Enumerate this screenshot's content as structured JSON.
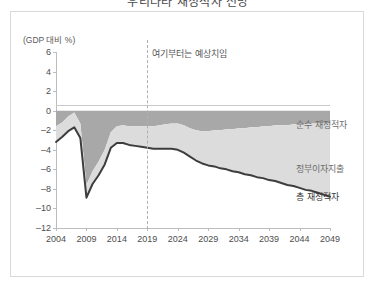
{
  "title": "우리나라 재정적자 전망",
  "card": {
    "unit_caption": "(GDP 대비 %)",
    "projection_note": "여기부터는 예상치임"
  },
  "legend": [
    {
      "label": "순수 재정적자",
      "color": "#a8a8a8",
      "key": "net-deficit"
    },
    {
      "label": "정부이자지출",
      "color": "#dcdcdc",
      "key": "interest-expense"
    },
    {
      "label": "총 재정적자",
      "color": "#3d3d3d",
      "key": "total-deficit"
    }
  ],
  "chart_data": {
    "type": "area",
    "title": "우리나라 재정적자 전망",
    "xlabel": "",
    "ylabel": "(GDP 대비 %)",
    "ylim": [
      -12,
      6
    ],
    "xlim": [
      2004,
      2049
    ],
    "grid": false,
    "legend_position": "right",
    "yticks": [
      6,
      4,
      2,
      0,
      -2,
      -4,
      -6,
      -8,
      -10,
      -12
    ],
    "xticks": [
      2004,
      2009,
      2014,
      2019,
      2024,
      2029,
      2034,
      2039,
      2044,
      2049
    ],
    "annotations": [
      {
        "text": "여기부터는 예상치임",
        "x": 2019,
        "type": "projection-divider"
      }
    ],
    "x": [
      2004,
      2005,
      2006,
      2007,
      2008,
      2009,
      2010,
      2011,
      2012,
      2013,
      2014,
      2015,
      2016,
      2017,
      2018,
      2019,
      2020,
      2021,
      2022,
      2023,
      2024,
      2025,
      2026,
      2027,
      2028,
      2029,
      2030,
      2031,
      2032,
      2033,
      2034,
      2035,
      2036,
      2037,
      2038,
      2039,
      2040,
      2041,
      2042,
      2043,
      2044,
      2045,
      2046,
      2047,
      2048,
      2049
    ],
    "series": [
      {
        "name": "순수 재정적자",
        "color": "#a8a8a8",
        "stack": "deficit",
        "values": [
          -1.6,
          -1.2,
          -0.6,
          -0.2,
          -1.3,
          -7.6,
          -6.2,
          -5.2,
          -4.0,
          -2.2,
          -1.6,
          -1.5,
          -1.6,
          -1.6,
          -1.6,
          -1.6,
          -1.6,
          -1.5,
          -1.4,
          -1.3,
          -1.3,
          -1.5,
          -1.8,
          -2.0,
          -2.1,
          -2.1,
          -2.0,
          -2.0,
          -1.9,
          -1.9,
          -1.8,
          -1.8,
          -1.7,
          -1.7,
          -1.6,
          -1.6,
          -1.5,
          -1.5,
          -1.5,
          -1.4,
          -1.4,
          -1.4,
          -1.3,
          -1.3,
          -1.3,
          -1.3
        ]
      },
      {
        "name": "정부이자지출",
        "color": "#dcdcdc",
        "stack": "deficit",
        "values": [
          -1.6,
          -1.5,
          -1.5,
          -1.5,
          -1.5,
          -1.3,
          -1.3,
          -1.4,
          -1.5,
          -1.6,
          -1.7,
          -1.8,
          -1.9,
          -2.0,
          -2.1,
          -2.2,
          -2.3,
          -2.4,
          -2.5,
          -2.6,
          -2.7,
          -2.8,
          -2.9,
          -3.1,
          -3.3,
          -3.5,
          -3.7,
          -3.9,
          -4.1,
          -4.3,
          -4.5,
          -4.7,
          -4.9,
          -5.1,
          -5.3,
          -5.5,
          -5.7,
          -5.9,
          -6.1,
          -6.3,
          -6.5,
          -6.7,
          -6.9,
          -7.1,
          -7.3,
          -7.5
        ]
      }
    ],
    "total_line": {
      "name": "총 재정적자",
      "color": "#3d3d3d",
      "values": [
        -3.2,
        -2.7,
        -2.1,
        -1.7,
        -2.8,
        -8.9,
        -7.5,
        -6.6,
        -5.5,
        -3.8,
        -3.3,
        -3.3,
        -3.5,
        -3.6,
        -3.7,
        -3.8,
        -3.9,
        -3.9,
        -3.9,
        -3.9,
        -4.0,
        -4.3,
        -4.7,
        -5.1,
        -5.4,
        -5.6,
        -5.7,
        -5.9,
        -6.0,
        -6.2,
        -6.3,
        -6.5,
        -6.6,
        -6.8,
        -6.9,
        -7.1,
        -7.2,
        -7.4,
        -7.6,
        -7.7,
        -7.9,
        -8.1,
        -8.2,
        -8.4,
        -8.6,
        -8.8
      ]
    }
  }
}
